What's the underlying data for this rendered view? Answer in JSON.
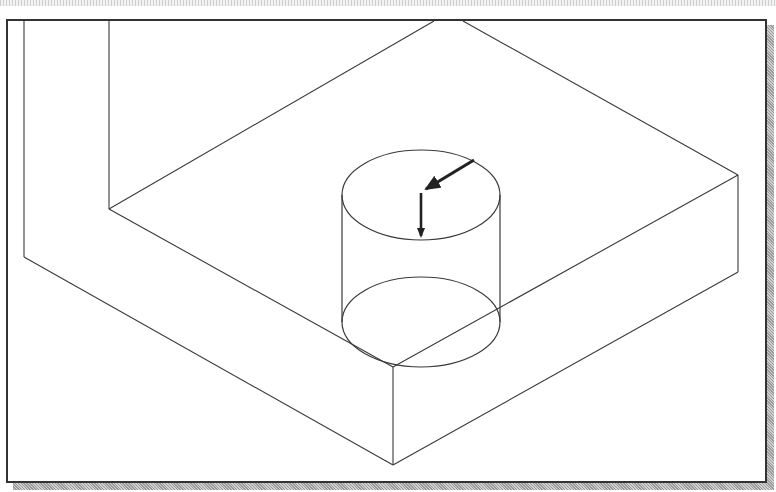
{
  "figure": {
    "colors": {
      "line": "#3a3a3a",
      "frame": "#333333",
      "arrow": "#222222",
      "background": "#ffffff",
      "shadow": "#a8a8a8"
    },
    "block": {
      "wall_outer_left_x": 24,
      "wall_inner_left_x": 109,
      "top_edge_points": [
        434,
        463
      ]
    },
    "cylinder": {
      "top_center": [
        421,
        195
      ],
      "bottom_center": [
        421,
        322
      ],
      "rx": 79,
      "ry": 45
    },
    "arrows": [
      {
        "name": "slanted-arrow",
        "from": [
          473,
          161
        ],
        "to": [
          426,
          189
        ]
      },
      {
        "name": "down-arrow",
        "from": [
          421,
          193
        ],
        "to": [
          421,
          236
        ]
      }
    ]
  }
}
